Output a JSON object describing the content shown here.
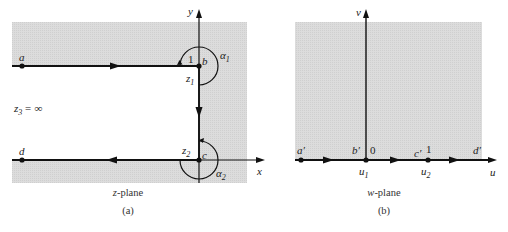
{
  "colors": {
    "shade": "#d9d9d9",
    "line": "#111111",
    "background": "#ffffff"
  },
  "panel_a": {
    "caption": "(a)",
    "plane_label": "z-plane",
    "axis_x": "x",
    "axis_y": "y",
    "points": {
      "a": "a",
      "b": "b",
      "c": "c",
      "d": "d"
    },
    "z1": "z",
    "z1_sub": "1",
    "z2": "z",
    "z2_sub": "2",
    "z3": "z",
    "z3_sub": "3",
    "z3_value": "= ∞",
    "alpha1": "α",
    "alpha1_sub": "1",
    "alpha2": "α",
    "alpha2_sub": "2",
    "corner_label": "1"
  },
  "panel_b": {
    "caption": "(b)",
    "plane_label": "w-plane",
    "axis_u": "u",
    "axis_v": "v",
    "points": {
      "a": "a′",
      "b": "b′",
      "c": "c′",
      "d": "d′"
    },
    "zero": "0",
    "one": "1",
    "u1": "u",
    "u1_sub": "1",
    "u2": "u",
    "u2_sub": "2"
  }
}
